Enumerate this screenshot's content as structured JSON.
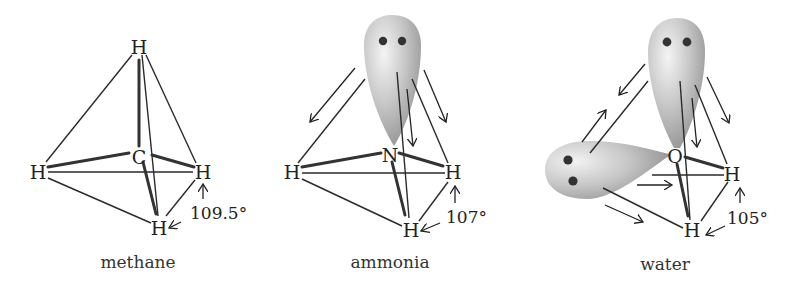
{
  "figure": {
    "panels": [
      {
        "id": "methane",
        "caption": "methane",
        "central_atom": "C",
        "hydrogens": [
          "H",
          "H",
          "H",
          "H"
        ],
        "bond_angle": "109.5°",
        "lone_pairs": 0
      },
      {
        "id": "ammonia",
        "caption": "ammonia",
        "central_atom": "N",
        "hydrogens": [
          "H",
          "H",
          "H"
        ],
        "bond_angle": "107°",
        "lone_pairs": 1
      },
      {
        "id": "water",
        "caption": "water",
        "central_atom": "O",
        "hydrogens": [
          "H",
          "H"
        ],
        "bond_angle": "105°",
        "lone_pairs": 2
      }
    ]
  }
}
